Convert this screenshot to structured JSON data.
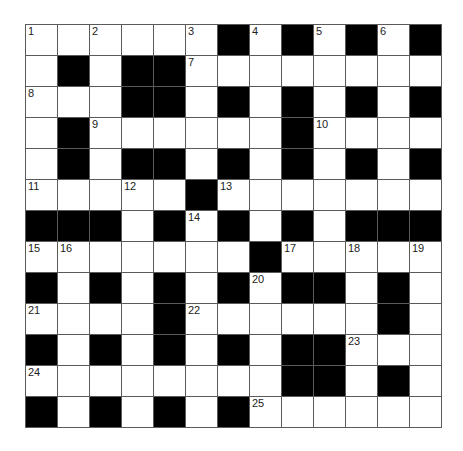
{
  "puzzle": {
    "rows": 13,
    "cols": 13,
    "colors": {
      "block": "#000000",
      "cell": "#ffffff",
      "line": "#5a5a5a"
    },
    "layout": [
      "......#.#.#.#",
      ".#.##........",
      "...##.#.#.#.#",
      ".#......#....",
      ".#.##.#.#.#.#",
      ".....#.......",
      "###.#.#.#.###",
      ".......#.....",
      "#.#.#.#.##.#.",
      "....#......#.",
      "#.#.#.#.##...",
      "........##.#.",
      "#.#.#.#......"
    ],
    "numbers": [
      {
        "r": 0,
        "c": 0,
        "n": "1"
      },
      {
        "r": 0,
        "c": 2,
        "n": "2"
      },
      {
        "r": 0,
        "c": 5,
        "n": "3"
      },
      {
        "r": 0,
        "c": 7,
        "n": "4"
      },
      {
        "r": 0,
        "c": 9,
        "n": "5"
      },
      {
        "r": 0,
        "c": 11,
        "n": "6"
      },
      {
        "r": 1,
        "c": 5,
        "n": "7"
      },
      {
        "r": 2,
        "c": 0,
        "n": "8"
      },
      {
        "r": 3,
        "c": 2,
        "n": "9"
      },
      {
        "r": 3,
        "c": 9,
        "n": "10"
      },
      {
        "r": 5,
        "c": 0,
        "n": "11"
      },
      {
        "r": 5,
        "c": 3,
        "n": "12"
      },
      {
        "r": 5,
        "c": 6,
        "n": "13"
      },
      {
        "r": 6,
        "c": 5,
        "n": "14"
      },
      {
        "r": 7,
        "c": 0,
        "n": "15"
      },
      {
        "r": 7,
        "c": 1,
        "n": "16"
      },
      {
        "r": 7,
        "c": 8,
        "n": "17"
      },
      {
        "r": 7,
        "c": 10,
        "n": "18"
      },
      {
        "r": 7,
        "c": 12,
        "n": "19"
      },
      {
        "r": 8,
        "c": 7,
        "n": "20"
      },
      {
        "r": 9,
        "c": 0,
        "n": "21"
      },
      {
        "r": 9,
        "c": 5,
        "n": "22"
      },
      {
        "r": 10,
        "c": 10,
        "n": "23"
      },
      {
        "r": 11,
        "c": 0,
        "n": "24"
      },
      {
        "r": 12,
        "c": 7,
        "n": "25"
      }
    ]
  }
}
